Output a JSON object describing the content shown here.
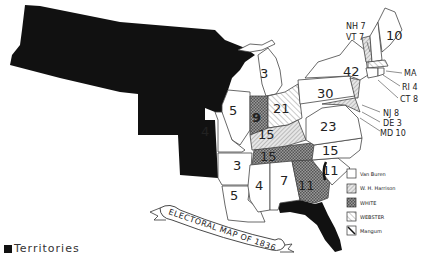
{
  "title": "ELECTORAL MAP OF 1836",
  "legend": {
    "items": [
      {
        "label": "Van Buren",
        "pattern": "blank",
        "color": "#ffffff"
      },
      {
        "label": "W. H. Harrison",
        "pattern": "light-hatch",
        "color": "#d0d0d0"
      },
      {
        "label": "White",
        "pattern": "dark-check",
        "color": "#888888"
      },
      {
        "label": "Webster",
        "pattern": "diagonal",
        "color": "#bbbbbb"
      },
      {
        "label": "Mangum",
        "pattern": "diagonal-bold",
        "color": "#999999"
      }
    ],
    "territories_label": "Territories",
    "territories_color": "#111111"
  },
  "states": [
    {
      "name": "ME",
      "votes": "10",
      "winner": "Van Buren"
    },
    {
      "name": "NH",
      "votes": "7",
      "winner": "Van Buren",
      "callout": "NH 7"
    },
    {
      "name": "VT",
      "votes": "7",
      "winner": "Harrison",
      "callout": "VT 7"
    },
    {
      "name": "NY",
      "votes": "42",
      "winner": "Van Buren"
    },
    {
      "name": "MA",
      "votes": "14",
      "winner": "Webster",
      "callout": "MA"
    },
    {
      "name": "RI",
      "votes": "4",
      "winner": "Van Buren",
      "callout": "RI 4"
    },
    {
      "name": "CT",
      "votes": "8",
      "winner": "Van Buren",
      "callout": "CT 8"
    },
    {
      "name": "NJ",
      "votes": "8",
      "winner": "Harrison",
      "callout": "NJ 8"
    },
    {
      "name": "DE",
      "votes": "3",
      "winner": "Harrison",
      "callout": "DE 3"
    },
    {
      "name": "MD",
      "votes": "10",
      "winner": "Harrison",
      "callout": "MD 10"
    },
    {
      "name": "PA",
      "votes": "30",
      "winner": "Van Buren"
    },
    {
      "name": "VA",
      "votes": "23",
      "winner": "Van Buren"
    },
    {
      "name": "NC",
      "votes": "15",
      "winner": "Van Buren"
    },
    {
      "name": "SC",
      "votes": "11",
      "winner": "Mangum"
    },
    {
      "name": "GA",
      "votes": "11",
      "winner": "White"
    },
    {
      "name": "OH",
      "votes": "21",
      "winner": "Harrison"
    },
    {
      "name": "MI",
      "votes": "3",
      "winner": "Van Buren"
    },
    {
      "name": "IN",
      "votes": "9",
      "winner": "Harrison"
    },
    {
      "name": "IL",
      "votes": "5",
      "winner": "Van Buren"
    },
    {
      "name": "KY",
      "votes": "15",
      "winner": "Harrison"
    },
    {
      "name": "TN",
      "votes": "15",
      "winner": "White"
    },
    {
      "name": "MO",
      "votes": "4",
      "winner": "Van Buren"
    },
    {
      "name": "AR",
      "votes": "3",
      "winner": "Van Buren"
    },
    {
      "name": "LA",
      "votes": "5",
      "winner": "Van Buren"
    },
    {
      "name": "MS",
      "votes": "4",
      "winner": "Van Buren"
    },
    {
      "name": "AL",
      "votes": "7",
      "winner": "Van Buren"
    }
  ]
}
